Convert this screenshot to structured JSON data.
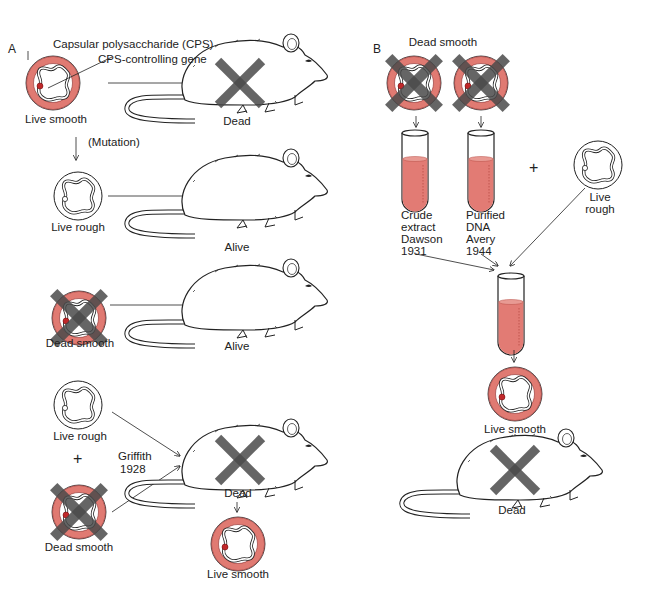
{
  "panels": {
    "A": {
      "letter": "A",
      "annotations": {
        "cps": "Capsular polysaccharide (CPS)",
        "gene": "CPS-controlling gene"
      },
      "rows": [
        {
          "bacterium": "Live smooth",
          "mouse": "Dead"
        },
        {
          "bacterium": "Live rough",
          "mouse": "Alive",
          "transition": "(Mutation)"
        },
        {
          "bacterium": "Dead smooth",
          "mouse": "Alive"
        },
        {
          "bacteria": [
            "Live rough",
            "Dead smooth"
          ],
          "plus": "+",
          "experiment": "Griffith",
          "year": "1928",
          "mouse": "Dead",
          "recovered": "Live smooth"
        }
      ]
    },
    "B": {
      "letter": "B",
      "source": "Dead smooth",
      "tubes": [
        {
          "line1": "Crude",
          "line2": "extract",
          "line3": "Dawson",
          "line4": "1931"
        },
        {
          "line1": "Purified",
          "line2": "DNA",
          "line3": "Avery",
          "line4": "1944"
        }
      ],
      "plus": "+",
      "added": {
        "line1": "Live",
        "line2": "rough"
      },
      "result": "Live smooth",
      "mouse": "Dead"
    }
  },
  "colors": {
    "capsule": "#e07a72",
    "capsule_edge": "#8a2a2a",
    "gene": "#c0282a",
    "tube_fill": "#e27b74",
    "cross": "#555555",
    "line": "#222222"
  }
}
